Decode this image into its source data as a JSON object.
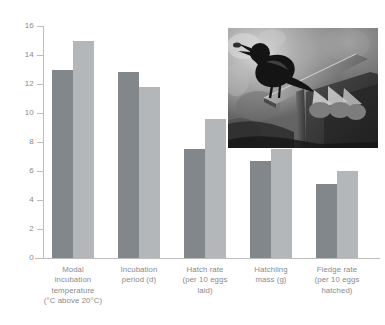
{
  "chart_data": {
    "type": "bar",
    "title": "",
    "subtitle": "",
    "xlabel": "",
    "ylabel": "",
    "ylim": [
      0,
      16
    ],
    "yticks": [
      0,
      2,
      4,
      6,
      8,
      10,
      12,
      14,
      16
    ],
    "grid": false,
    "legend_position": "none",
    "categories": [
      "Modal\nincubation\ntemperature\n(°C above 20°C)",
      "Incubation\nperiod (d)",
      "Hatch rate\n(per 10 eggs\nlaid)",
      "Hatchling\nmass (g)",
      "Fledge rate\n(per 10 eggs\nhatched)"
    ],
    "series": [
      {
        "name": "series-dark",
        "color": "#82878c",
        "values": [
          13.0,
          12.8,
          7.5,
          6.7,
          5.1
        ]
      },
      {
        "name": "series-light",
        "color": "#b4b7b9",
        "values": [
          15.0,
          11.8,
          9.6,
          7.5,
          6.0
        ]
      }
    ],
    "axis_color": "#bcbcbc",
    "tick_label_color": "#8a8a8a",
    "background": "#ffffff"
  },
  "inset": {
    "name": "starling-at-nest-box-photo",
    "description": "Black and white photograph of an adult starling perched on the roof of a wooden nest box with a chick begging below",
    "monochrome": true
  }
}
